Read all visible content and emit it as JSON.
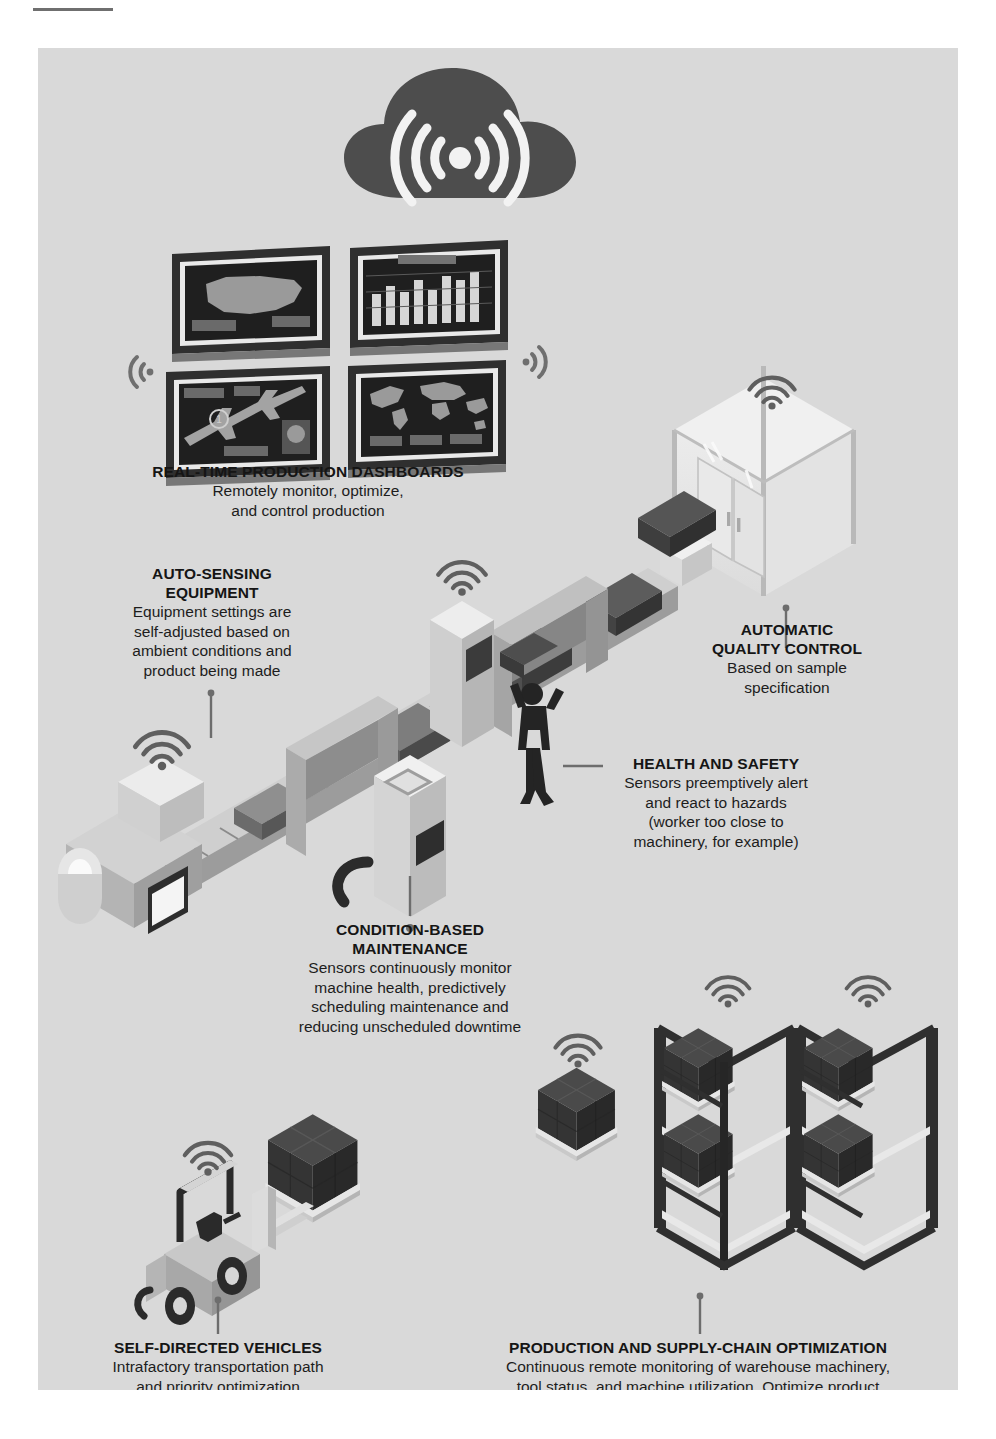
{
  "page": {
    "background_color": "#d9d9d9",
    "margin_color": "#ffffff"
  },
  "palette": {
    "cloud_dark": "#4d4d4d",
    "screen_dark": "#2b2b2b",
    "machine_light": "#e3e3e3",
    "machine_mid": "#b3b3b3",
    "machine_dark": "#6f6f6f",
    "pallet_dark": "#404040",
    "text": "#151515",
    "leader": "#6d6d6d"
  },
  "icons": {
    "cloud": "cloud-wifi-icon",
    "wifi_left": "wifi-signal-left-icon",
    "wifi_right": "wifi-signal-right-icon",
    "wifi_up": "wifi-signal-up-icon"
  },
  "callouts": [
    {
      "id": "real-time-production-dashboards",
      "title": "REAL-TIME PRODUCTION DASHBOARDS",
      "lines": [
        "Remotely monitor, optimize,",
        "and control production"
      ]
    },
    {
      "id": "auto-sensing-equipment",
      "title_lines": [
        "AUTO-SENSING",
        "EQUIPMENT"
      ],
      "title": "AUTO-SENSING EQUIPMENT",
      "lines": [
        "Equipment settings are",
        "self-adjusted based on",
        "ambient conditions and",
        "product being made"
      ]
    },
    {
      "id": "automatic-quality-control",
      "title_lines": [
        "AUTOMATIC",
        "QUALITY CONTROL"
      ],
      "title": "AUTOMATIC QUALITY CONTROL",
      "lines": [
        "Based on sample",
        "specification"
      ]
    },
    {
      "id": "health-and-safety",
      "title": "HEALTH AND SAFETY",
      "lines": [
        "Sensors preemptively alert",
        "and react to hazards",
        "(worker too close to",
        "machinery, for example)"
      ]
    },
    {
      "id": "condition-based-maintenance",
      "title_lines": [
        "CONDITION-BASED",
        "MAINTENANCE"
      ],
      "title": "CONDITION-BASED MAINTENANCE",
      "lines": [
        "Sensors continuously monitor",
        "machine health, predictively",
        "scheduling maintenance and",
        "reducing unscheduled downtime"
      ]
    },
    {
      "id": "self-directed-vehicles",
      "title": "SELF-DIRECTED VEHICLES",
      "lines": [
        "Intrafactory transportation path",
        "and priority optimization"
      ]
    },
    {
      "id": "production-and-supply-chain-optimization",
      "title": "PRODUCTION AND SUPPLY-CHAIN OPTIMIZATION",
      "lines": [
        "Continuous remote monitoring of warehouse machinery,",
        "tool status, and machine utilization. Optimize product",
        "flow and production setup"
      ]
    }
  ],
  "dashboards": {
    "screens": [
      {
        "name": "usa-map-screen",
        "content": "map of the united states"
      },
      {
        "name": "bar-chart-screen",
        "content": "bar chart"
      },
      {
        "name": "aircraft-schematic-screen",
        "content": "aircraft schematic"
      },
      {
        "name": "world-map-screen",
        "content": "world map"
      }
    ]
  }
}
